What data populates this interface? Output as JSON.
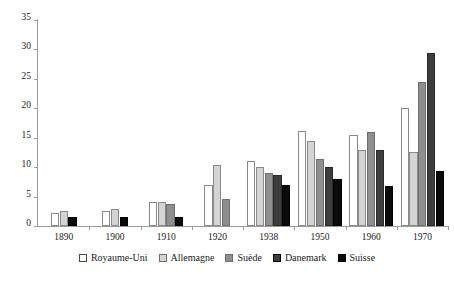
{
  "chart_data": {
    "type": "bar",
    "title": "",
    "xlabel": "",
    "ylabel": "",
    "ylim": [
      0,
      35
    ],
    "yticks": [
      0,
      5,
      10,
      15,
      20,
      25,
      30,
      35
    ],
    "grid": false,
    "legend_position": "bottom",
    "categories": [
      "1890",
      "1900",
      "1910",
      "1920",
      "1938",
      "1950",
      "1960",
      "1970"
    ],
    "series": [
      {
        "name": "Royaume-Uni",
        "color": "#ffffff",
        "values": [
          2.2,
          2.6,
          4.0,
          7.0,
          11.0,
          16.2,
          15.4,
          20.0
        ]
      },
      {
        "name": "Allemagne",
        "color": "#d4d4d4",
        "values": [
          2.6,
          2.9,
          4.1,
          10.4,
          10.1,
          14.4,
          13.0,
          12.5
        ]
      },
      {
        "name": "Suède",
        "color": "#8f8f8f",
        "values": [
          null,
          null,
          3.8,
          4.6,
          9.0,
          11.4,
          15.9,
          24.5
        ]
      },
      {
        "name": "Danemark",
        "color": "#3d3d3d",
        "values": [
          null,
          null,
          null,
          null,
          8.6,
          10.0,
          12.9,
          29.4
        ]
      },
      {
        "name": "Suisse",
        "color": "#0a0a0a",
        "values": [
          1.6,
          1.5,
          1.6,
          null,
          6.9,
          8.0,
          6.8,
          9.3
        ]
      }
    ]
  },
  "legend": {
    "items": [
      {
        "label": "Royaume-Uni"
      },
      {
        "label": "Allemagne"
      },
      {
        "label": "Suède"
      },
      {
        "label": "Danemark"
      },
      {
        "label": "Suisse"
      }
    ]
  },
  "axis": {
    "y_tick_labels": [
      "0",
      "5",
      "10",
      "15",
      "20",
      "25",
      "30",
      "35"
    ]
  }
}
